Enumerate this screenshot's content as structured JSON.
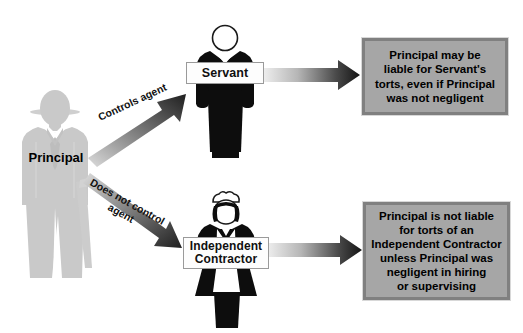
{
  "diagram": {
    "background_color": "#ffffff"
  },
  "actors": {
    "principal": {
      "label": "Principal",
      "icon": "businessman-silhouette-icon",
      "color": "#c9c9c9",
      "label_color": "#000000"
    },
    "servant": {
      "label": "Servant",
      "icon": "servant-person-icon",
      "color": "#0d0d0d"
    },
    "contractor": {
      "label": "Independent\nContractor",
      "label_line1": "Independent",
      "label_line2": "Contractor",
      "icon": "maid-worker-person-icon",
      "color": "#0d0d0d"
    }
  },
  "relations": {
    "controls": {
      "caption": "Controls agent",
      "arrow": "diagonal-up-arrow",
      "color": "#3a3a3a"
    },
    "not_controls": {
      "caption": "Does not control\nagent",
      "caption_line1": "Does not control",
      "caption_line2": "agent",
      "arrow": "diagonal-down-arrow",
      "color": "#3a3a3a"
    },
    "to_outcome_servant": {
      "arrow": "horizontal-gradient-arrow",
      "color_start": "#e8e8e8",
      "color_end": "#1a1a1a"
    },
    "to_outcome_contractor": {
      "arrow": "horizontal-gradient-arrow",
      "color_start": "#e8e8e8",
      "color_end": "#1a1a1a"
    }
  },
  "outcomes": {
    "servant": {
      "fill_color": "#a6a6a6",
      "border_color": "#808080",
      "lines": [
        "Principal may be",
        "liable for Servant's",
        "torts, even if Principal",
        "was not negligent"
      ]
    },
    "contractor": {
      "fill_color": "#a6a6a6",
      "border_color": "#808080",
      "lines": [
        "Principal is not liable",
        "for torts of an",
        "Independent Contractor",
        "unless Principal was",
        "negligent in hiring",
        "or supervising"
      ]
    }
  }
}
